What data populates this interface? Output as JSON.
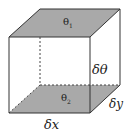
{
  "diagram": {
    "type": "cube-element",
    "labels": {
      "top_face": "θ",
      "top_face_sub": "1",
      "bottom_face": "θ",
      "bottom_face_sub": "2",
      "height": "δθ",
      "depth": "δy",
      "width": "δx"
    },
    "colors": {
      "face_fill": "#a9a9a9",
      "edge": "#333333",
      "background": "#ffffff"
    }
  }
}
